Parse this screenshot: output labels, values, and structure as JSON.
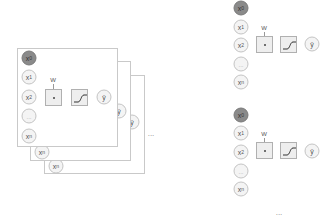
{
  "diagram": {
    "nodes": {
      "bias": "x0",
      "x1": "x1",
      "x2": "x2",
      "dots": "...",
      "xn": "xn",
      "output": "ŷ"
    },
    "weight_label": "W",
    "product_symbol": "•",
    "activation": "sigmoid",
    "continuation_ellipsis": "..."
  },
  "colors": {
    "bias_fill": "#8a8a8a",
    "node_fill": "#f4f4f4",
    "box_fill": "#eeeeee",
    "border": "#c9c9c9"
  }
}
